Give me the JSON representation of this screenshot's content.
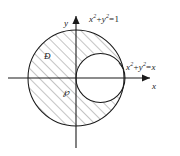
{
  "figure": {
    "name": "region-between-two-circles",
    "background_color": "#ffffff",
    "stroke_color": "#1a1a1a",
    "hatch_color": "#555555",
    "axes": {
      "x_axis_label": "x",
      "y_axis_label": "y",
      "origin_label": "℘",
      "origin_x": 76,
      "origin_y": 78
    },
    "labels": {
      "unit_circle_equation": {
        "lhs_var1": "x",
        "exp1": "2",
        "operator": "+",
        "lhs_var2": "y",
        "exp2": "2",
        "equals": "=",
        "rhs": "1",
        "full_text": "x² + y² = 1"
      },
      "small_circle_equation": {
        "lhs_var1": "x",
        "exp1": "2",
        "operator": "+",
        "lhs_var2": "y",
        "exp2": "2",
        "equals": "=",
        "rhs": "x",
        "full_text": "x² + y² = x"
      },
      "shaded_region_label": "Đ"
    },
    "curves": [
      {
        "name": "unit-circle",
        "equation": "x² + y² = 1",
        "center_x": 76,
        "center_y": 78,
        "radius": 48
      },
      {
        "name": "small-circle",
        "equation": "x² + y² = x",
        "center_x": 100.5,
        "center_y": 78,
        "radius": 24.5
      }
    ],
    "shaded_region": {
      "name": "region-D",
      "description": "inside unit circle and outside small circle",
      "hatch_angle_degrees": 45,
      "hatch_spacing": 7
    }
  }
}
